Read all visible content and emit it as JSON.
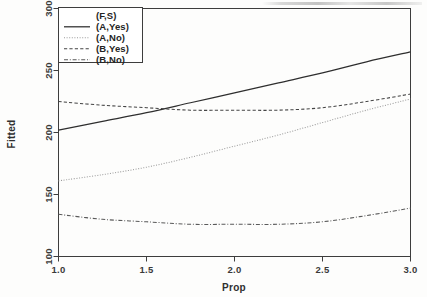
{
  "chart_data": {
    "type": "line",
    "title": "",
    "xlabel": "Prop",
    "ylabel": "Fitted",
    "xlim": [
      1.0,
      3.0
    ],
    "ylim": [
      100,
      300
    ],
    "xticks": [
      "1.0",
      "1.5",
      "2.0",
      "2.5",
      "3.0"
    ],
    "xtick_values": [
      1.0,
      1.5,
      2.0,
      2.5,
      3.0
    ],
    "yticks": [
      "100",
      "150",
      "200",
      "250",
      "300"
    ],
    "ytick_values": [
      100,
      150,
      200,
      250,
      300
    ],
    "grid": false,
    "legend_position": "top-left",
    "legend_title": "(F,S)",
    "x": [
      1.0,
      1.25,
      1.5,
      1.75,
      2.0,
      2.25,
      2.5,
      2.75,
      3.0
    ],
    "series": [
      {
        "name": "(A,Yes)",
        "linestyle": "solid",
        "color": "#2e2e2e",
        "values": [
          202,
          209,
          216,
          224,
          232,
          240,
          248,
          257,
          265
        ]
      },
      {
        "name": "(A,No)",
        "linestyle": "dotted",
        "color": "#9a9a9a",
        "values": [
          161,
          166,
          172,
          180,
          189,
          198,
          208,
          218,
          227
        ]
      },
      {
        "name": "(B,Yes)",
        "linestyle": "dashed",
        "color": "#444444",
        "values": [
          225,
          222,
          220,
          218,
          218,
          218,
          220,
          225,
          231
        ]
      },
      {
        "name": "(B,No)",
        "linestyle": "dashdot",
        "color": "#5a5a5a",
        "values": [
          134,
          130,
          128,
          126,
          126,
          126,
          128,
          133,
          139
        ]
      }
    ]
  },
  "axes": {
    "x_title": "Prop",
    "y_title": "Fitted"
  },
  "legend": {
    "title": "(F,S)",
    "entries": [
      {
        "label": "(A,Yes)",
        "style": "solid"
      },
      {
        "label": "(A,No)",
        "style": "dotted"
      },
      {
        "label": "(B,Yes)",
        "style": "dashed"
      },
      {
        "label": "(B,No)",
        "style": "dashdot"
      }
    ]
  }
}
